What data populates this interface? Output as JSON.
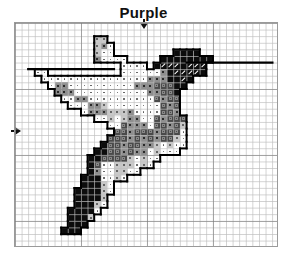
{
  "title": "Purple",
  "markers": {
    "top_arrow": "center-column-marker",
    "left_arrow": "center-row-marker"
  },
  "grid": {
    "cols": 40,
    "rows": 34,
    "cell_px": 6.6,
    "major_every": 10
  },
  "legend_symbols": {
    "w": "white with dot",
    "l": "light gray with dot",
    "m": "medium gray with square",
    "d": "dark gray",
    "k": "black",
    "s": "black with white slash"
  },
  "colors": {
    "w": "#ffffff",
    "l": "#c9c9c9",
    "m": "#8e8e8e",
    "d": "#4a4a4a",
    "k": "#0c0c0c",
    "s": "#0c0c0c"
  },
  "pattern": [
    "........................................",
    "........................................",
    "............ll..........................",
    "............lmw.........................",
    "............lww.........kkkk............",
    "............mwwww.....kkkkkkkk..........",
    "................wwww.ksssksss...........",
    "...ww...........wwwwwwmkssssk...........",
    "....wwwwwwwwwwwwwwwwmmmkksk.............",
    ".....wmmwwwwwwwwwwmmmdddkk..............",
    "......mmmwwwwwwwwwwwmmddk...............",
    ".......wwmmwwwwwwwwwwdmdd...............",
    "........wwwmmlwwwwwwwwdmd...............",
    "..........wmmmlllmwwwwddm...............",
    "............wwlwlmmwwdmddd..............",
    "..............wwdmmmwddmdl..............",
    "...............ddmdddmdddw..............",
    "..............dddmdmdmddlw..............",
    ".............kddmddmmlwlww..............",
    "............kkddmdmmwlwww...............",
    "...........kkddddlwlww..................",
    "...........kdwwlllwlw...................",
    "...........kmwwllww.....................",
    "..........kkkwwlw.......................",
    "..........kkklw.........................",
    ".........kkkklw.........................",
    ".........kkkkl..........................",
    ".........kkklw..........................",
    "........kkkkw...........................",
    "........kkkl............................",
    "........kkk.............................",
    ".......kkk..............................",
    "........................................",
    "........................................"
  ],
  "beak_line": {
    "row": 5,
    "from_col": 26,
    "to_col": 38
  },
  "wing_line": {
    "row": 7,
    "from_col": 2,
    "to_col": 14
  }
}
